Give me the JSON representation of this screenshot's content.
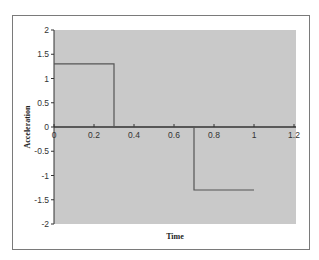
{
  "chart_data": {
    "type": "line",
    "title": "",
    "xlabel": "Time",
    "ylabel": "Acceleration",
    "xlim": [
      0,
      1.2
    ],
    "ylim": [
      -2,
      2
    ],
    "x_ticks": [
      "0",
      "0.2",
      "0.4",
      "0.6",
      "0.8",
      "1",
      "1.2"
    ],
    "y_ticks": [
      "2",
      "1.5",
      "1",
      "0.5",
      "0",
      "-0.5",
      "-1",
      "-1.5",
      "-2"
    ],
    "grid": false,
    "legend": null,
    "series": [
      {
        "name": "Acceleration",
        "x": [
          0,
          0.3,
          0.3,
          0.7,
          0.7,
          1.0
        ],
        "y": [
          1.3,
          1.3,
          0,
          0,
          -1.3,
          -1.3
        ]
      }
    ],
    "colors": {
      "plot_background": "#c9c9c9",
      "line": "#555555",
      "axis": "#333333",
      "frame_border": "#7a7a7a"
    }
  }
}
